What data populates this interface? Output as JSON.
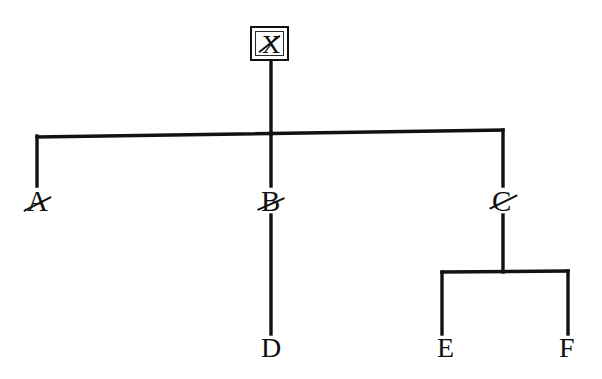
{
  "diagram": {
    "type": "tree",
    "background_color": "#ffffff",
    "ink_color": "#101010",
    "nodes": [
      {
        "id": "X",
        "label": "X",
        "level": 0,
        "x": 269,
        "y": 45,
        "boxed": true,
        "struck": true,
        "parent": null
      },
      {
        "id": "A",
        "label": "A",
        "level": 1,
        "x": 37,
        "y": 206,
        "boxed": false,
        "struck": true,
        "parent": "X"
      },
      {
        "id": "B",
        "label": "B",
        "level": 1,
        "x": 271,
        "y": 206,
        "boxed": false,
        "struck": true,
        "parent": "X"
      },
      {
        "id": "C",
        "label": "C",
        "level": 1,
        "x": 503,
        "y": 206,
        "boxed": false,
        "struck": true,
        "parent": "X"
      },
      {
        "id": "D",
        "label": "D",
        "level": 2,
        "x": 271,
        "y": 352,
        "boxed": false,
        "struck": false,
        "parent": "B"
      },
      {
        "id": "E",
        "label": "E",
        "level": 2,
        "x": 446,
        "y": 352,
        "boxed": false,
        "struck": false,
        "parent": "C"
      },
      {
        "id": "F",
        "label": "F",
        "level": 2,
        "x": 568,
        "y": 352,
        "boxed": false,
        "struck": false,
        "parent": "C"
      }
    ],
    "edges": [
      {
        "from": "X",
        "to": "A",
        "kind": "elbow"
      },
      {
        "from": "X",
        "to": "B",
        "kind": "straight"
      },
      {
        "from": "X",
        "to": "C",
        "kind": "elbow"
      },
      {
        "from": "B",
        "to": "D",
        "kind": "straight"
      },
      {
        "from": "C",
        "to": "E",
        "kind": "elbow"
      },
      {
        "from": "C",
        "to": "F",
        "kind": "elbow"
      }
    ]
  }
}
